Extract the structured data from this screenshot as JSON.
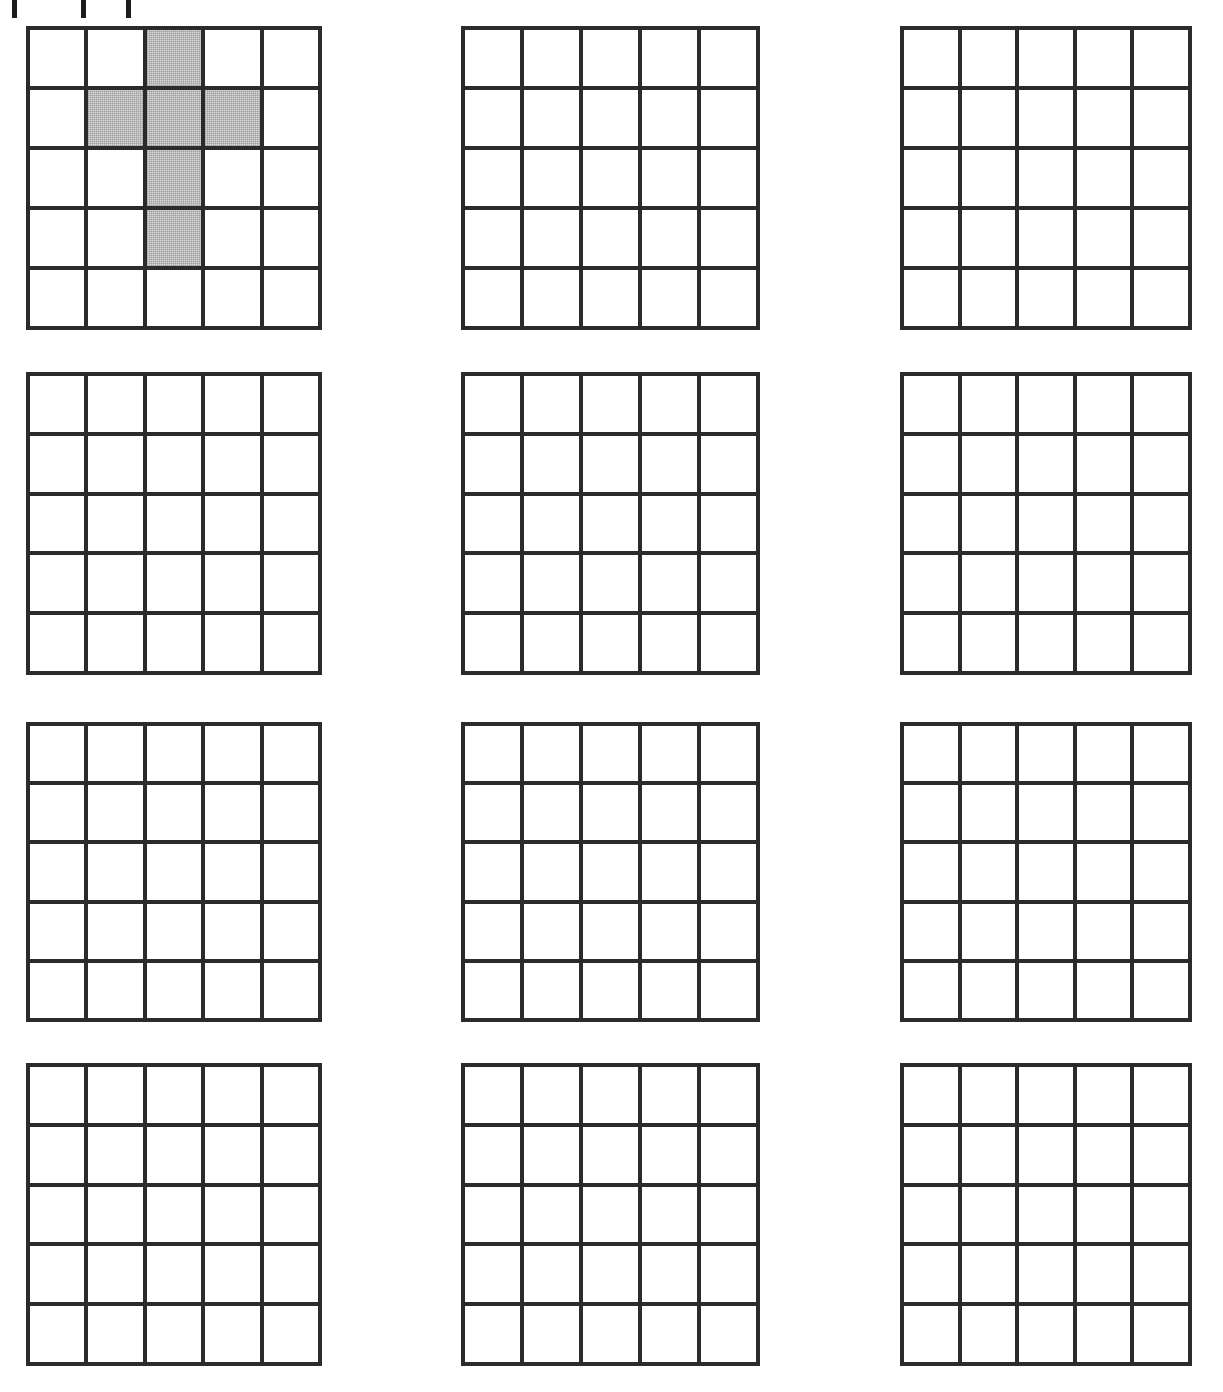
{
  "page": {
    "background_color": "#ffffff",
    "width": 1223,
    "height": 1392
  },
  "style": {
    "grid_line_color": "#2b2b2b",
    "grid_line_width_px": 4,
    "shaded_cell_color": "#dcdcdc",
    "empty_cell_color": "#ffffff"
  },
  "top_clipped_marks": [
    {
      "name": "clip-mark-1",
      "x": 12,
      "width": 5,
      "height": 18
    },
    {
      "name": "clip-mark-2",
      "x": 81,
      "width": 5,
      "height": 18
    },
    {
      "name": "clip-mark-3",
      "x": 126,
      "width": 5,
      "height": 18
    }
  ],
  "layout": {
    "columns": 3,
    "rows": 4,
    "grid_rows_cols": 5,
    "column_left": [
      26,
      461,
      900
    ],
    "column_width": [
      296,
      299,
      292
    ],
    "row_top": [
      26,
      372,
      722,
      1063
    ],
    "row_height": [
      304,
      303,
      300,
      303
    ]
  },
  "grids": [
    {
      "id": "grid-1",
      "label": "Grid 1",
      "position": {
        "row": 0,
        "col": 0
      },
      "shaded_cells": [
        {
          "row": 0,
          "col": 2
        },
        {
          "row": 1,
          "col": 1
        },
        {
          "row": 1,
          "col": 2
        },
        {
          "row": 1,
          "col": 3
        },
        {
          "row": 2,
          "col": 2
        },
        {
          "row": 3,
          "col": 2
        }
      ],
      "shaded_count": 6
    },
    {
      "id": "grid-2",
      "label": "Grid 2",
      "position": {
        "row": 0,
        "col": 1
      },
      "shaded_cells": [],
      "shaded_count": 0
    },
    {
      "id": "grid-3",
      "label": "Grid 3",
      "position": {
        "row": 0,
        "col": 2
      },
      "shaded_cells": [],
      "shaded_count": 0
    },
    {
      "id": "grid-4",
      "label": "Grid 4",
      "position": {
        "row": 1,
        "col": 0
      },
      "shaded_cells": [],
      "shaded_count": 0
    },
    {
      "id": "grid-5",
      "label": "Grid 5",
      "position": {
        "row": 1,
        "col": 1
      },
      "shaded_cells": [],
      "shaded_count": 0
    },
    {
      "id": "grid-6",
      "label": "Grid 6",
      "position": {
        "row": 1,
        "col": 2
      },
      "shaded_cells": [],
      "shaded_count": 0
    },
    {
      "id": "grid-7",
      "label": "Grid 7",
      "position": {
        "row": 2,
        "col": 0
      },
      "shaded_cells": [],
      "shaded_count": 0
    },
    {
      "id": "grid-8",
      "label": "Grid 8",
      "position": {
        "row": 2,
        "col": 1
      },
      "shaded_cells": [],
      "shaded_count": 0
    },
    {
      "id": "grid-9",
      "label": "Grid 9",
      "position": {
        "row": 2,
        "col": 2
      },
      "shaded_cells": [],
      "shaded_count": 0
    },
    {
      "id": "grid-10",
      "label": "Grid 10",
      "position": {
        "row": 3,
        "col": 0
      },
      "shaded_cells": [],
      "shaded_count": 0
    },
    {
      "id": "grid-11",
      "label": "Grid 11",
      "position": {
        "row": 3,
        "col": 1
      },
      "shaded_cells": [],
      "shaded_count": 0
    },
    {
      "id": "grid-12",
      "label": "Grid 12",
      "position": {
        "row": 3,
        "col": 2
      },
      "shaded_cells": [],
      "shaded_count": 0
    }
  ]
}
